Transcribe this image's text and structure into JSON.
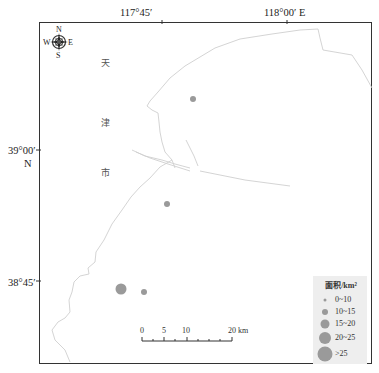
{
  "map": {
    "top_axis_labels": [
      {
        "text": "117°45′",
        "x": 120,
        "y": 8
      },
      {
        "text": "118°00′  E",
        "x": 272,
        "y": 8
      }
    ],
    "left_axis_labels": [
      {
        "text": "39°00′",
        "x": 8,
        "y": 146
      },
      {
        "text": "N",
        "x": 23,
        "y": 160
      },
      {
        "text": "38°45′",
        "x": 8,
        "y": 278
      }
    ],
    "region_label_chars": [
      "天",
      "津",
      "市"
    ],
    "compass": {
      "n": "N",
      "s": "S",
      "e": "E",
      "w": "W"
    },
    "scale_bar": {
      "ticks": [
        "0",
        "5",
        "10",
        "20 km"
      ]
    },
    "points": [
      {
        "x": 193,
        "y": 99,
        "r": 3,
        "class": "10-15"
      },
      {
        "x": 167,
        "y": 204,
        "r": 3,
        "class": "10-15"
      },
      {
        "x": 121,
        "y": 289,
        "r": 5.5,
        "class": "15-20"
      },
      {
        "x": 144,
        "y": 292,
        "r": 3,
        "class": "10-15"
      }
    ],
    "colors": {
      "point_fill": "#9a9a9a",
      "coastline": "#cfcfcf",
      "frame": "#333333",
      "legend_bg": "#eeeeee"
    }
  },
  "legend": {
    "title": "面积/km²",
    "items": [
      {
        "label": "0~10",
        "r": 1.5
      },
      {
        "label": "10~15",
        "r": 3
      },
      {
        "label": "15~20",
        "r": 4.5
      },
      {
        "label": "20~25",
        "r": 6
      },
      {
        "label": ">25",
        "r": 7.5
      }
    ]
  }
}
